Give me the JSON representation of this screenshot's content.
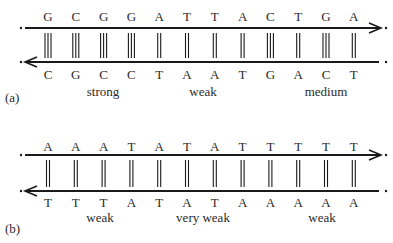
{
  "panels": [
    {
      "id": "a",
      "tag": "(a)",
      "top_strand": [
        "G",
        "C",
        "G",
        "G",
        "A",
        "T",
        "T",
        "A",
        "C",
        "T",
        "G",
        "A"
      ],
      "bottom_strand": [
        "C",
        "G",
        "C",
        "C",
        "T",
        "A",
        "A",
        "T",
        "G",
        "A",
        "C",
        "T"
      ],
      "bonds": [
        3,
        3,
        3,
        3,
        2,
        2,
        2,
        2,
        3,
        2,
        3,
        2
      ],
      "top_arrow": "right",
      "bottom_arrow": "left",
      "labels": [
        {
          "text": "strong",
          "x": 103
        },
        {
          "text": "weak",
          "x": 203
        },
        {
          "text": "medium",
          "x": 326
        }
      ]
    },
    {
      "id": "b",
      "tag": "(b)",
      "top_strand": [
        "A",
        "A",
        "A",
        "T",
        "A",
        "T",
        "A",
        "T",
        "T",
        "T",
        "T",
        "T"
      ],
      "bottom_strand": [
        "T",
        "T",
        "T",
        "A",
        "T",
        "A",
        "T",
        "A",
        "A",
        "A",
        "A",
        "A"
      ],
      "bonds": [
        2,
        2,
        2,
        2,
        2,
        2,
        2,
        2,
        2,
        2,
        2,
        2
      ],
      "top_arrow": "right",
      "bottom_arrow": "left",
      "labels": [
        {
          "text": "weak",
          "x": 100
        },
        {
          "text": "very weak",
          "x": 203
        },
        {
          "text": "weak",
          "x": 322
        }
      ]
    }
  ],
  "colors": {
    "line": "#1a1a1a",
    "text": "#2a2a2a",
    "background": "#ffffff"
  }
}
